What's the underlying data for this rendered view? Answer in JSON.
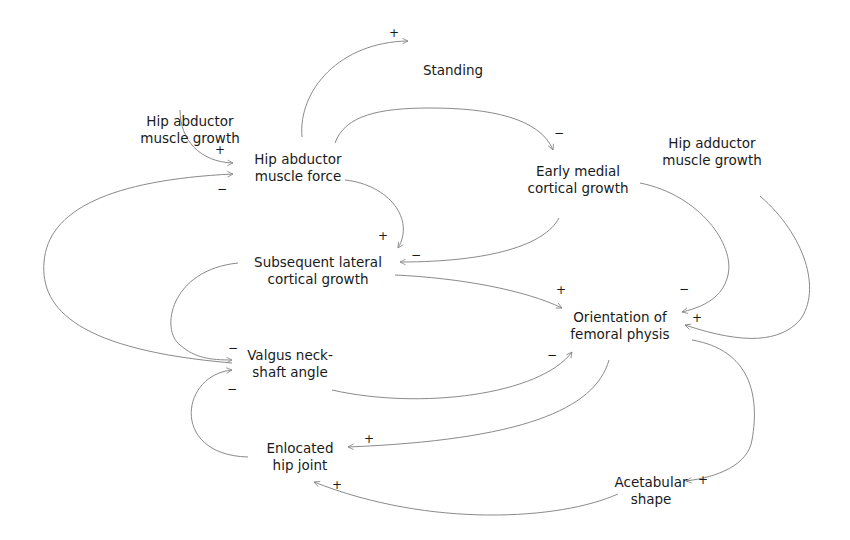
{
  "diagram": {
    "type": "causal-loop",
    "edge_color": "#8a8a8a",
    "text_color": "#1a1a1a",
    "nodes": [
      {
        "id": "standing",
        "lines": [
          "Standing"
        ],
        "x": 453,
        "y": 70
      },
      {
        "id": "hip_abductor_growth",
        "lines": [
          "Hip abductor",
          "muscle growth"
        ],
        "x": 190,
        "y": 131
      },
      {
        "id": "hip_adductor_growth",
        "lines": [
          "Hip adductor",
          "muscle growth"
        ],
        "x": 710,
        "y": 153
      },
      {
        "id": "hip_abductor_force",
        "lines": [
          "Hip abductor",
          "muscle force"
        ],
        "x": 297,
        "y": 276
      },
      {
        "id": "early_medial",
        "lines": [
          "Early medial",
          "cortical growth"
        ],
        "x": 578,
        "y": 291
      },
      {
        "id": "subsequent_lateral",
        "lines": [
          "Subsequent lateral",
          "cortical growth"
        ],
        "x": 318,
        "y": 432
      },
      {
        "id": "orientation",
        "lines": [
          "Orientation of",
          "femoral physis"
        ],
        "x": 618,
        "y": 518
      },
      {
        "id": "valgus",
        "lines": [
          "Valgus neck-",
          "shaft angle"
        ],
        "x": 288,
        "y": 575
      },
      {
        "id": "enlocated",
        "lines": [
          "Enlocated",
          "hip joint"
        ],
        "x": 298,
        "y": 720
      },
      {
        "id": "acetabular",
        "lines": [
          "Acetabular",
          "shape"
        ],
        "x": 650,
        "y": 755
      }
    ],
    "edges": [
      {
        "from": "hip_abductor_force",
        "to": "standing",
        "sign": "+"
      },
      {
        "from": "hip_abductor_growth",
        "to": "hip_abductor_force",
        "sign": "+"
      },
      {
        "from": "valgus",
        "to": "hip_abductor_force",
        "sign": "−"
      },
      {
        "from": "hip_abductor_force",
        "to": "early_medial",
        "sign": "−"
      },
      {
        "from": "hip_abductor_force",
        "to": "subsequent_lateral",
        "sign": "+"
      },
      {
        "from": "early_medial",
        "to": "subsequent_lateral",
        "sign": "−"
      },
      {
        "from": "early_medial",
        "to": "orientation",
        "sign": "−"
      },
      {
        "from": "hip_adductor_growth",
        "to": "orientation",
        "sign": "+"
      },
      {
        "from": "subsequent_lateral",
        "to": "orientation",
        "sign": "+"
      },
      {
        "from": "subsequent_lateral",
        "to": "valgus",
        "sign": "−"
      },
      {
        "from": "valgus",
        "to": "orientation",
        "sign": "−"
      },
      {
        "from": "enlocated",
        "to": "valgus",
        "sign": "−"
      },
      {
        "from": "orientation",
        "to": "enlocated",
        "sign": "+"
      },
      {
        "from": "orientation",
        "to": "acetabular",
        "sign": "+"
      },
      {
        "from": "acetabular",
        "to": "enlocated",
        "sign": "+"
      }
    ]
  },
  "labels": {
    "standing": [
      "Standing"
    ],
    "hip_abductor_growth": [
      "Hip abductor",
      "muscle growth"
    ],
    "hip_adductor_growth": [
      "Hip adductor",
      "muscle growth"
    ],
    "hip_abductor_force": [
      "Hip abductor",
      "muscle force"
    ],
    "early_medial": [
      "Early medial",
      "cortical growth"
    ],
    "subsequent_lateral": [
      "Subsequent lateral",
      "cortical growth"
    ],
    "orientation": [
      "Orientation of",
      "femoral physis"
    ],
    "valgus": [
      "Valgus neck-",
      "shaft angle"
    ],
    "enlocated": [
      "Enlocated",
      "hip joint"
    ],
    "acetabular": [
      "Acetabular",
      "shape"
    ]
  },
  "signs": {
    "s1": "+",
    "s2": "+",
    "s3": "−",
    "s4": "−",
    "s5": "+",
    "s6": "−",
    "s7": "−",
    "s8": "+",
    "s9": "+",
    "s10": "−",
    "s11": "−",
    "s12": "−",
    "s13": "+",
    "s14": "+",
    "s15": "+"
  }
}
